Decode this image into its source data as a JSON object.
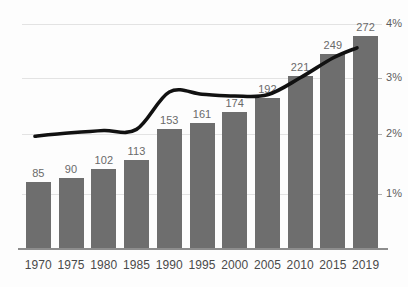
{
  "chart_data": {
    "type": "bar",
    "title": "",
    "subtitle": "",
    "xlabel": "",
    "ylabel": "",
    "categories": [
      "1970",
      "1975",
      "1980",
      "1985",
      "1990",
      "1995",
      "2000",
      "2005",
      "2010",
      "2015",
      "2019"
    ],
    "values": [
      85,
      90,
      102,
      113,
      153,
      161,
      174,
      192,
      221,
      249,
      272
    ],
    "value_labels": [
      "85",
      "90",
      "102",
      "113",
      "153",
      "161",
      "174",
      "192",
      "221",
      "249",
      "272"
    ],
    "bar_color": "#6e6e6e",
    "bar_label_color": "#6a6a6a",
    "grid": true,
    "gridline_color": "#e3e3e3",
    "legend": "none",
    "series": [
      {
        "name": "bars",
        "axis": "left",
        "type": "bar",
        "values": [
          85,
          90,
          102,
          113,
          153,
          161,
          174,
          192,
          221,
          249,
          272
        ]
      },
      {
        "name": "percent-line",
        "axis": "right",
        "type": "line",
        "color": "#111111",
        "tick_labels": [
          "1%",
          "2%",
          "3%",
          "4%"
        ],
        "values": [
          2.02,
          2.08,
          2.12,
          2.14,
          2.8,
          2.76,
          2.73,
          2.75,
          3.05,
          3.4,
          3.58
        ]
      }
    ],
    "secondary_axis": {
      "position": "right",
      "ticks": [
        "1%",
        "2%",
        "3%",
        "4%"
      ],
      "tick_values": [
        1,
        2,
        3,
        4
      ],
      "ylim": [
        0,
        4.3
      ],
      "label_color": "#5d5d5d"
    }
  }
}
